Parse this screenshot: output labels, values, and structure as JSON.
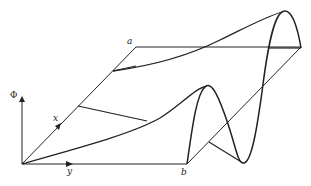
{
  "diagram": {
    "type": "surface-plot-3d",
    "labels": {
      "phi_axis": "Φ",
      "x_axis": "x",
      "y_axis": "y",
      "corner_a": "a",
      "corner_b": "b"
    },
    "colors": {
      "ink": "#222222",
      "background": "#ffffff"
    }
  }
}
